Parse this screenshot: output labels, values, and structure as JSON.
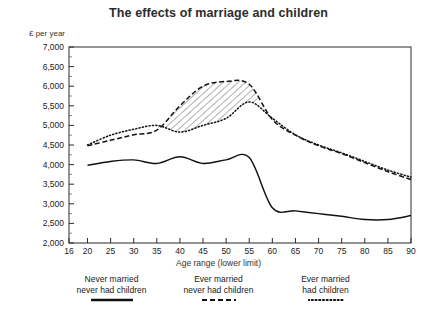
{
  "chart_data": {
    "type": "line",
    "title": "The effects of marriage and children",
    "ylabel": "£ per year",
    "xlabel": "Age range (lower limit)",
    "ylim": [
      2000,
      7000
    ],
    "xlim": [
      16,
      90
    ],
    "grid": false,
    "legend_position": "bottom",
    "yticks": [
      "7,000",
      "6,500",
      "6,000",
      "5,500",
      "5,000",
      "4,500",
      "4,000",
      "3,500",
      "3,000",
      "2,500",
      "2,000"
    ],
    "ytick_values": [
      7000,
      6500,
      6000,
      5500,
      5000,
      4500,
      4000,
      3500,
      3000,
      2500,
      2000
    ],
    "xticks": [
      "16",
      "20",
      "25",
      "30",
      "35",
      "40",
      "45",
      "50",
      "55",
      "60",
      "65",
      "70",
      "75",
      "80",
      "85",
      "90"
    ],
    "xtick_values": [
      16,
      20,
      25,
      30,
      35,
      40,
      45,
      50,
      55,
      60,
      65,
      70,
      75,
      80,
      85,
      90
    ],
    "x": [
      20,
      25,
      30,
      35,
      40,
      45,
      50,
      55,
      60,
      65,
      70,
      75,
      80,
      85,
      90
    ],
    "series": [
      {
        "name": "Never married never had children",
        "style": "solid",
        "color": "#111111",
        "values": [
          3980,
          4080,
          4120,
          4030,
          4200,
          4030,
          4120,
          4180,
          2900,
          2820,
          2750,
          2680,
          2600,
          2600,
          2700
        ]
      },
      {
        "name": "Ever married never had children",
        "style": "dashed",
        "color": "#111111",
        "values": [
          4480,
          4620,
          4760,
          4880,
          5500,
          6000,
          6120,
          6050,
          5150,
          4750,
          4480,
          4280,
          4050,
          3820,
          3620
        ]
      },
      {
        "name": "Ever married had children",
        "style": "dotted",
        "color": "#111111",
        "values": [
          4500,
          4750,
          4900,
          5000,
          4830,
          5000,
          5180,
          5600,
          5180,
          4760,
          4500,
          4300,
          4080,
          3860,
          3680
        ]
      }
    ],
    "annotations": [
      {
        "name": "hatched-gap",
        "between": [
          "Ever married never had children",
          "Ever married had children"
        ],
        "x_from": 35,
        "x_to": 57
      }
    ]
  },
  "legend": {
    "items": [
      {
        "line1": "Never married",
        "line2": "never had children",
        "swatch": "solid-line-swatch"
      },
      {
        "line1": "Ever married",
        "line2": "never had children",
        "swatch": "dashed-line-swatch"
      },
      {
        "line1": "Ever married",
        "line2": "had children",
        "swatch": "dotted-line-swatch"
      }
    ]
  }
}
